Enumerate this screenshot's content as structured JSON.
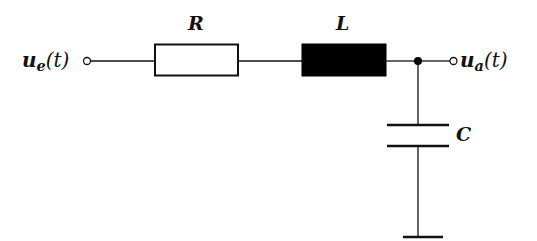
{
  "diagram": {
    "type": "circuit-schematic",
    "colors": {
      "line": "#111111",
      "background": "#ffffff",
      "inductor_fill": "#000000",
      "resistor_fill": "#ffffff"
    },
    "input": {
      "symbol": "u",
      "subscript": "e",
      "argument": "(t)"
    },
    "output": {
      "symbol": "u",
      "subscript": "a",
      "argument": "(t)"
    },
    "components": [
      {
        "id": "R",
        "label": "R",
        "kind": "resistor"
      },
      {
        "id": "L",
        "label": "L",
        "kind": "inductor"
      },
      {
        "id": "C",
        "label": "C",
        "kind": "capacitor"
      }
    ],
    "ground": {
      "kind": "ground"
    }
  }
}
